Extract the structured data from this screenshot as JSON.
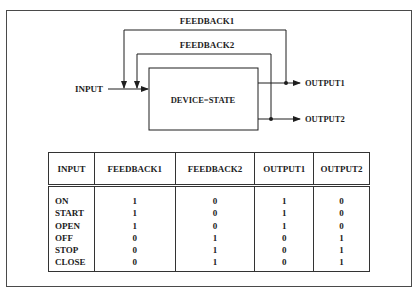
{
  "diagram": {
    "feedback1_label": "FEEDBACK1",
    "feedback2_label": "FEEDBACK2",
    "input_label": "INPUT",
    "device_label": "DEVICE=STATE",
    "output1_label": "OUTPUT1",
    "output2_label": "OUTPUT2",
    "line_color": "#1e1e1e"
  },
  "table": {
    "headers": [
      "INPUT",
      "FEEDBACK1",
      "FEEDBACK2",
      "OUTPUT1",
      "OUTPUT2"
    ],
    "rows": [
      {
        "input": "ON",
        "feedback1": "1",
        "feedback2": "0",
        "output1": "1",
        "output2": "0"
      },
      {
        "input": "START",
        "feedback1": "1",
        "feedback2": "0",
        "output1": "1",
        "output2": "0"
      },
      {
        "input": "OPEN",
        "feedback1": "1",
        "feedback2": "0",
        "output1": "1",
        "output2": "0"
      },
      {
        "input": "OFF",
        "feedback1": "0",
        "feedback2": "1",
        "output1": "0",
        "output2": "1"
      },
      {
        "input": "STOP",
        "feedback1": "0",
        "feedback2": "1",
        "output1": "0",
        "output2": "1"
      },
      {
        "input": "CLOSE",
        "feedback1": "0",
        "feedback2": "1",
        "output1": "0",
        "output2": "1"
      }
    ]
  }
}
